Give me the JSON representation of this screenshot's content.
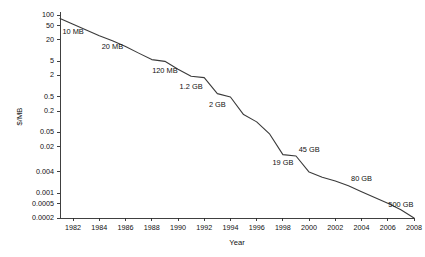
{
  "chart_data": {
    "type": "line",
    "title": "",
    "subtitle": "",
    "xlabel": "Year",
    "ylabel": "$/MB",
    "yscale": "log",
    "xscale": "linear",
    "grid": false,
    "legend": null,
    "xlim": [
      1981,
      2008
    ],
    "ylim": [
      0.0002,
      100
    ],
    "x_tick_labels": [
      "1982",
      "1984",
      "1986",
      "1988",
      "1990",
      "1992",
      "1994",
      "1996",
      "1998",
      "2000",
      "2002",
      "2004",
      "2006",
      "2008"
    ],
    "x_ticks": [
      1982,
      1984,
      1986,
      1988,
      1990,
      1992,
      1994,
      1996,
      1998,
      2000,
      2002,
      2004,
      2006,
      2008
    ],
    "y_tick_labels": [
      "100",
      "50",
      "20",
      "5",
      "2",
      "0.5",
      "0.2",
      "0.05",
      "0.02",
      "0.004",
      "0.001",
      "0.0005",
      "0.0002"
    ],
    "y_ticks": [
      100,
      50,
      20,
      5,
      2,
      0.5,
      0.2,
      0.05,
      0.02,
      0.004,
      0.001,
      0.0005,
      0.0002
    ],
    "series": [
      {
        "name": "Cost per megabyte",
        "x": [
          1981,
          1982,
          1983,
          1984,
          1985,
          1986,
          1987,
          1988,
          1989,
          1990,
          1991,
          1992,
          1993,
          1994,
          1995,
          1996,
          1997,
          1998,
          1999,
          2000,
          2001,
          2002,
          2003,
          2004,
          2005,
          2006,
          2007,
          2008
        ],
        "values": [
          80,
          55,
          38,
          26,
          19,
          13,
          8.5,
          5.6,
          5.0,
          3.0,
          1.9,
          1.75,
          0.62,
          0.5,
          0.16,
          0.1,
          0.045,
          0.012,
          0.011,
          0.0039,
          0.0028,
          0.0022,
          0.0016,
          0.0011,
          0.00075,
          0.00052,
          0.00034,
          0.0002
        ]
      }
    ],
    "annotations": [
      {
        "label": "10 MB",
        "year": 1982,
        "value": 30
      },
      {
        "label": "20 MB",
        "year": 1985,
        "value": 11
      },
      {
        "label": "120 MB",
        "year": 1989,
        "value": 2.4
      },
      {
        "label": "1.2 GB",
        "year": 1991,
        "value": 0.85
      },
      {
        "label": "2 GB",
        "year": 1993,
        "value": 0.26
      },
      {
        "label": "19 GB",
        "year": 1998,
        "value": 0.0062
      },
      {
        "label": "45 GB",
        "year": 2000,
        "value": 0.0145
      },
      {
        "label": "80 GB",
        "year": 2004,
        "value": 0.0022
      },
      {
        "label": "500 GB",
        "year": 2007,
        "value": 0.00042
      }
    ]
  },
  "style": {
    "line_color": "#3a3a3a",
    "axis_color": "#2b2b2b",
    "text_color": "#111111",
    "background": "#ffffff"
  }
}
